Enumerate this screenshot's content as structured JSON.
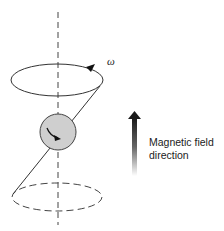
{
  "diagram": {
    "omega_label": "ω",
    "field_label_line1": "Magnetic field",
    "field_label_line2": "direction",
    "colors": {
      "stroke": "#333333",
      "sphere_fill": "#cfcfcf",
      "arrow_top": "#1a1a1a",
      "arrow_bottom": "#ffffff"
    }
  }
}
